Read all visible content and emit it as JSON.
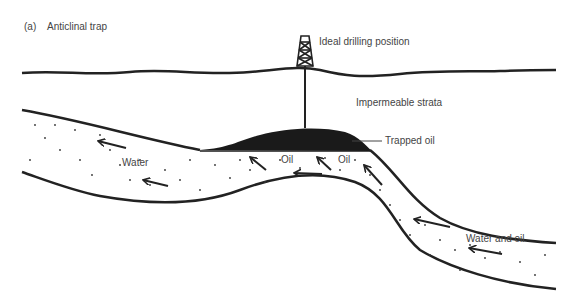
{
  "figure": {
    "panel_label": "(a)",
    "title": "Anticlinal trap"
  },
  "labels": {
    "drilling": "Ideal drilling position",
    "strata": "Impermeable strata",
    "trapped_oil": "Trapped oil",
    "water": "Water",
    "oil_1": "Oil",
    "oil_2": "Oil",
    "water_and_oil": "Water and oil"
  },
  "colors": {
    "line": "#222222",
    "oil": "#1a1a1a",
    "text": "#444444",
    "dots": "#333333"
  }
}
